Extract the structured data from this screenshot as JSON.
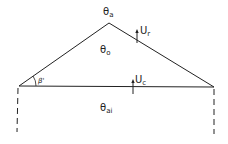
{
  "diagram": {
    "type": "roof-cross-section",
    "labels": {
      "outdoor_temp": {
        "symbol": "θ",
        "sub": "a"
      },
      "attic_temp": {
        "symbol": "θ",
        "sub": "o"
      },
      "indoor_temp": {
        "symbol": "θ",
        "sub": "ai"
      },
      "roof_u": {
        "symbol": "U",
        "sub": "r"
      },
      "ceiling_u": {
        "symbol": "U",
        "sub": "c"
      },
      "pitch_angle": "β'"
    },
    "colors": {
      "line": "#222222",
      "background": "#ffffff"
    }
  }
}
